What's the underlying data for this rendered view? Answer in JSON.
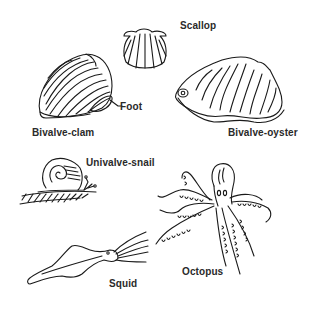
{
  "diagram": {
    "colors": {
      "background": "#ffffff",
      "ink": "#1a1a1a",
      "label": "#2a2a2a"
    },
    "labels": {
      "scallop": "Scallop",
      "foot": "Foot",
      "bivalve_clam": "Bivalve-clam",
      "bivalve_oyster": "Bivalve-oyster",
      "univalve_snail": "Univalve-snail",
      "squid": "Squid",
      "octopus": "Octopus"
    },
    "specimens": [
      {
        "name": "Bivalve-clam",
        "part_label": "Foot"
      },
      {
        "name": "Scallop"
      },
      {
        "name": "Bivalve-oyster"
      },
      {
        "name": "Univalve-snail"
      },
      {
        "name": "Squid"
      },
      {
        "name": "Octopus"
      }
    ]
  }
}
